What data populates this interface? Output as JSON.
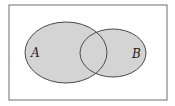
{
  "diagram": {
    "type": "venn",
    "universe": {
      "x": 9,
      "y": 5,
      "width": 158,
      "height": 95,
      "stroke": "#6e6e6e",
      "fill": "#ffffff"
    },
    "sets": [
      {
        "label": "A",
        "cx": 66,
        "cy": 52.5,
        "rx": 41,
        "ry": 30.5,
        "fill": "#d4d4d4",
        "stroke": "#4a4a4a",
        "label_x": 31,
        "label_y": 57
      },
      {
        "label": "B",
        "cx": 113,
        "cy": 53,
        "rx": 33,
        "ry": 24,
        "fill": "#d4d4d4",
        "stroke": "#4a4a4a",
        "label_x": 132,
        "label_y": 58
      }
    ]
  }
}
